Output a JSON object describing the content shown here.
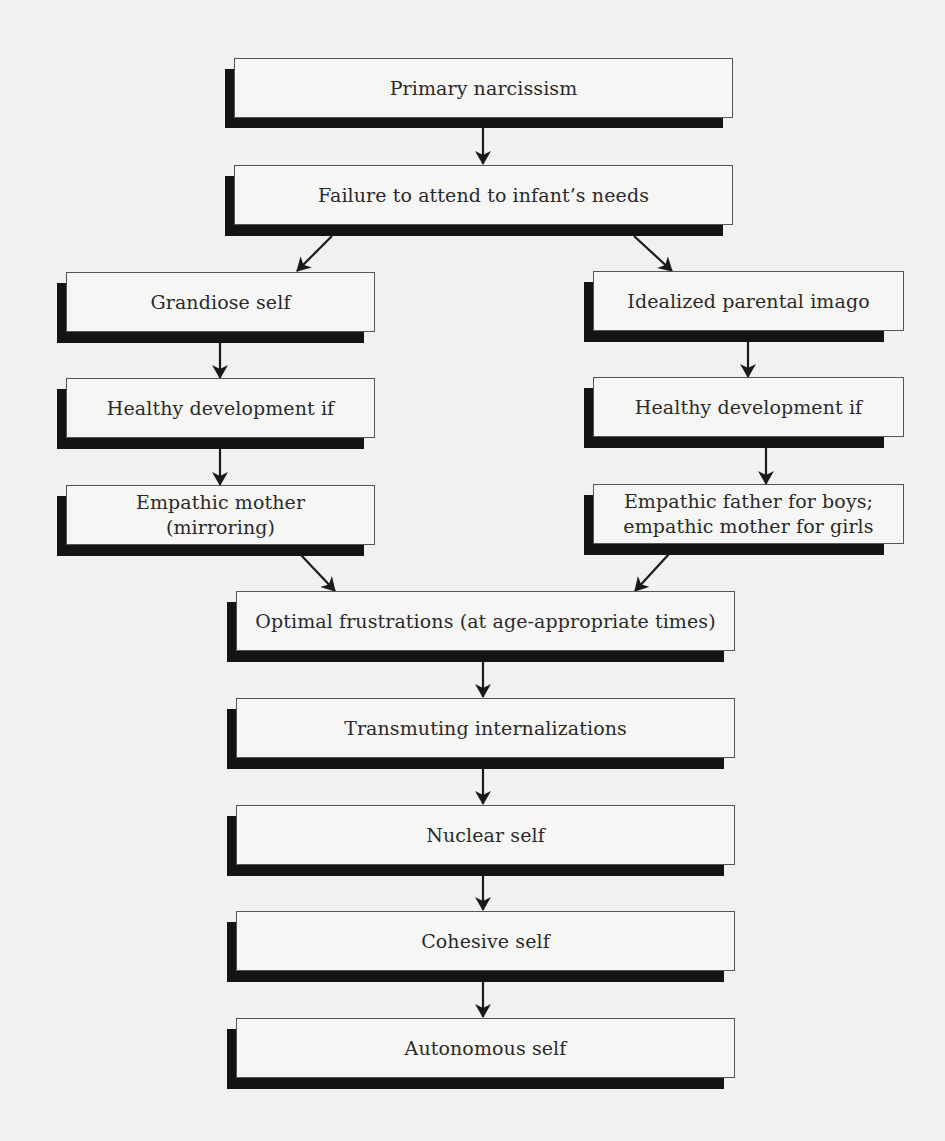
{
  "diagram": {
    "type": "flowchart",
    "nodes": {
      "primary_narcissism": "Primary narcissism",
      "failure_to_attend": "Failure to attend to infant’s needs",
      "grandiose_self": "Grandiose self",
      "idealized_parental_imago": "Idealized parental imago",
      "healthy_development_left": "Healthy development if",
      "healthy_development_right": "Healthy development if",
      "empathic_mother": "Empathic mother\n(mirroring)",
      "empathic_father": "Empathic father for boys;\nempathic mother for girls",
      "optimal_frustrations": "Optimal frustrations (at age-appropriate times)",
      "transmuting_internalizations": "Transmuting internalizations",
      "nuclear_self": "Nuclear self",
      "cohesive_self": "Cohesive self",
      "autonomous_self": "Autonomous self"
    },
    "edges": [
      [
        "primary_narcissism",
        "failure_to_attend"
      ],
      [
        "failure_to_attend",
        "grandiose_self"
      ],
      [
        "failure_to_attend",
        "idealized_parental_imago"
      ],
      [
        "grandiose_self",
        "healthy_development_left"
      ],
      [
        "healthy_development_left",
        "empathic_mother"
      ],
      [
        "idealized_parental_imago",
        "healthy_development_right"
      ],
      [
        "healthy_development_right",
        "empathic_father"
      ],
      [
        "empathic_mother",
        "optimal_frustrations"
      ],
      [
        "empathic_father",
        "optimal_frustrations"
      ],
      [
        "optimal_frustrations",
        "transmuting_internalizations"
      ],
      [
        "transmuting_internalizations",
        "nuclear_self"
      ],
      [
        "nuclear_self",
        "cohesive_self"
      ],
      [
        "cohesive_self",
        "autonomous_self"
      ]
    ]
  },
  "colors": {
    "background": "#f1f1ef",
    "box_fill": "#f6f6f4",
    "box_border": "#555555",
    "shadow": "#141414",
    "arrow": "#1a1a1a",
    "text": "#2a2a2a"
  }
}
